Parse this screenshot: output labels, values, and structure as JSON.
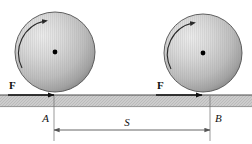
{
  "figure": {
    "background_color": "#ffffff",
    "width": 252,
    "height": 144
  },
  "labels": {
    "force_left": "F",
    "force_right": "F",
    "point_a": "A",
    "point_b": "B",
    "distance": "S"
  },
  "colors": {
    "ball_light": "#e8e8e8",
    "ball_mid": "#c2c2c2",
    "ball_dark": "#8f8f8f",
    "ball_outline": "#4a4a4a",
    "ground_fill": "#c9c9c9",
    "ground_line": "#5a5a5a",
    "line": "#1a1a1a",
    "dimension_line": "#555555",
    "center_dot": "#000000"
  },
  "balls": [
    {
      "name": "left-ball",
      "cx": 55,
      "cy": 52,
      "r": 40,
      "spin_direction": "clockwise",
      "has_center_dot": true
    },
    {
      "name": "right-ball",
      "cx": 203,
      "cy": 53,
      "r": 39,
      "spin_direction": "clockwise",
      "has_center_dot": true
    }
  ],
  "ground": {
    "x": 0,
    "y": 95,
    "width": 252,
    "height": 12
  },
  "force_arrows": [
    {
      "name": "force-arrow-left",
      "x1": 8,
      "y1": 95,
      "x2": 54,
      "y2": 95
    },
    {
      "name": "force-arrow-right",
      "x1": 156,
      "y1": 95,
      "x2": 202,
      "y2": 95
    }
  ],
  "dimension": {
    "name": "distance-dimension",
    "x_start": 54,
    "x_end": 210,
    "y": 130,
    "extension_top": 96,
    "extension_bottom": 141
  }
}
